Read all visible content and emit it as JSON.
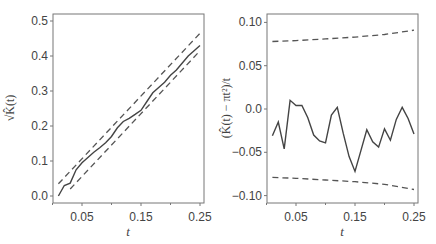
{
  "chart_data": [
    {
      "type": "line",
      "title": "",
      "xlabel": "t",
      "ylabel": "√K̂(t)",
      "xlim": [
        0.0,
        0.26
      ],
      "ylim": [
        -0.02,
        0.52
      ],
      "xticks": [
        0.05,
        0.15,
        0.25
      ],
      "xtick_labels": [
        "0.05",
        "0.15",
        "0.25"
      ],
      "yticks": [
        0.0,
        0.1,
        0.2,
        0.3,
        0.4,
        0.5
      ],
      "ytick_labels": [
        "0.0",
        "0.1",
        "0.2",
        "0.3",
        "0.4",
        "0.5"
      ],
      "grid": false,
      "legend": null,
      "series": [
        {
          "name": "estimate",
          "style": "solid",
          "x": [
            0.01,
            0.02,
            0.03,
            0.04,
            0.05,
            0.06,
            0.07,
            0.08,
            0.09,
            0.1,
            0.11,
            0.12,
            0.13,
            0.14,
            0.15,
            0.16,
            0.17,
            0.18,
            0.19,
            0.2,
            0.21,
            0.22,
            0.23,
            0.24,
            0.25
          ],
          "values": [
            0.0,
            0.03,
            0.037,
            0.075,
            0.095,
            0.11,
            0.125,
            0.138,
            0.152,
            0.17,
            0.195,
            0.213,
            0.222,
            0.233,
            0.245,
            0.27,
            0.295,
            0.31,
            0.325,
            0.345,
            0.36,
            0.38,
            0.4,
            0.415,
            0.43
          ]
        },
        {
          "name": "upper envelope",
          "style": "dashed",
          "x": [
            0.01,
            0.25
          ],
          "values": [
            0.035,
            0.465
          ]
        },
        {
          "name": "lower envelope",
          "style": "dashed",
          "x": [
            0.03,
            0.25
          ],
          "values": [
            0.02,
            0.415
          ]
        }
      ]
    },
    {
      "type": "line",
      "title": "",
      "xlabel": "t",
      "ylabel": "(K̂(t) − πt²)/t",
      "xlim": [
        0.0,
        0.26
      ],
      "ylim": [
        -0.108,
        0.108
      ],
      "xticks": [
        0.05,
        0.15,
        0.25
      ],
      "xtick_labels": [
        "0.05",
        "0.15",
        "0.25"
      ],
      "yticks": [
        0.1,
        0.05,
        0.0,
        -0.05,
        -0.1
      ],
      "ytick_labels": [
        "0.10",
        "0.05",
        "0.0",
        "−0.05",
        "−0.10"
      ],
      "grid": false,
      "legend": null,
      "series": [
        {
          "name": "estimate",
          "style": "solid",
          "x": [
            0.01,
            0.02,
            0.03,
            0.04,
            0.05,
            0.06,
            0.07,
            0.08,
            0.09,
            0.1,
            0.11,
            0.12,
            0.13,
            0.14,
            0.15,
            0.16,
            0.17,
            0.18,
            0.19,
            0.2,
            0.21,
            0.22,
            0.23,
            0.24,
            0.25
          ],
          "values": [
            -0.031,
            -0.015,
            -0.046,
            0.01,
            0.004,
            0.004,
            -0.01,
            -0.03,
            -0.037,
            -0.039,
            -0.007,
            0.002,
            -0.028,
            -0.055,
            -0.072,
            -0.048,
            -0.024,
            -0.038,
            -0.044,
            -0.023,
            -0.036,
            -0.012,
            0.002,
            -0.011,
            -0.029
          ]
        },
        {
          "name": "upper envelope",
          "style": "dashed",
          "x": [
            0.01,
            0.05,
            0.1,
            0.15,
            0.2,
            0.25
          ],
          "values": [
            0.078,
            0.079,
            0.081,
            0.083,
            0.086,
            0.091
          ]
        },
        {
          "name": "lower envelope",
          "style": "dashed",
          "x": [
            0.01,
            0.05,
            0.1,
            0.15,
            0.2,
            0.25
          ],
          "values": [
            -0.079,
            -0.08,
            -0.082,
            -0.084,
            -0.087,
            -0.093
          ]
        }
      ]
    }
  ]
}
